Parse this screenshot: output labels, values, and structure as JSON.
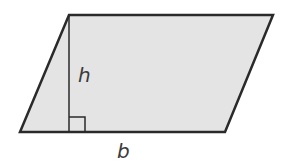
{
  "diagram": {
    "shape": "parallelogram",
    "fill_color": "#e4e4e4",
    "stroke_color": "#2a2a2a",
    "labels": {
      "height": "h",
      "base": "b"
    },
    "right_angle_marker": true
  }
}
